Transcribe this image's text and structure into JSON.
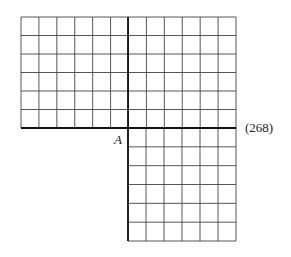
{
  "diagram": {
    "point_label": "A",
    "equation_number": "(268)",
    "top_grid": {
      "cols": 12,
      "rows": 6
    },
    "bottom_grid": {
      "cols": 6,
      "rows": 6
    },
    "line_color": "#333333"
  }
}
